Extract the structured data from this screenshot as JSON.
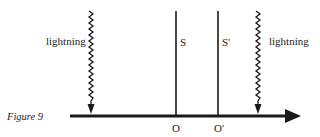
{
  "figure": {
    "caption": "Figure 9",
    "labels": {
      "lightning_left": "lightning",
      "lightning_right": "lightning",
      "S": "S",
      "S_prime": "S'",
      "O": "O",
      "O_prime": "O'"
    },
    "colors": {
      "ink": "#1a1a1a",
      "background": "#ffffff"
    },
    "elements": {
      "axis": "horizontal arrow pointing right",
      "observer_lines": [
        "S",
        "S'"
      ],
      "lightning_bolts": [
        "left",
        "right"
      ]
    }
  }
}
